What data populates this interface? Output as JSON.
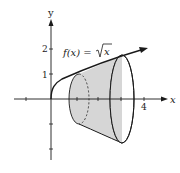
{
  "figure": {
    "function_label": "f(x) = √x",
    "function_prefix": "f(x) = ",
    "function_radicand": "x",
    "axes": {
      "x_label": "x",
      "y_label": "y",
      "y_ticks": [
        "1",
        "2"
      ],
      "x_ticks": [
        "4"
      ]
    },
    "solid": {
      "description": "solid of revolution of sqrt(x) about x-axis",
      "fill_color": "#d6d6d6",
      "stroke_color": "#1a1a1a"
    }
  }
}
